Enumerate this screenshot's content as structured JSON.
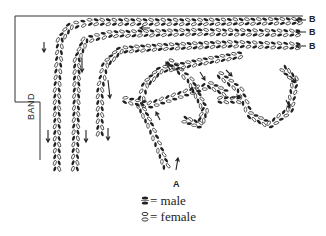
{
  "diagram": {
    "labels": {
      "entry_A": "A",
      "exits_B": [
        "B",
        "B",
        "B"
      ],
      "band": "BAND"
    },
    "legend": [
      {
        "icon": "solid-oval-pair-icon",
        "symbol": "filled",
        "text": "= male"
      },
      {
        "icon": "hollow-oval-pair-icon",
        "symbol": "hollow",
        "text": "= female"
      }
    ],
    "colors": {
      "ink": "#222222",
      "background": "#ffffff"
    }
  }
}
